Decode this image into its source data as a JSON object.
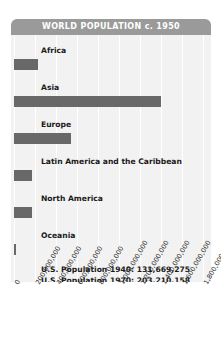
{
  "chart_data": {
    "type": "bar",
    "orientation": "horizontal",
    "title": "WORLD POPULATION c. 1950",
    "xlabel": "",
    "ylabel": "",
    "categories": [
      "Africa",
      "Asia",
      "Europe",
      "Latin America and the Caribbean",
      "North America",
      "Oceania"
    ],
    "values": [
      228000000,
      1400000000,
      547000000,
      167000000,
      172000000,
      13000000
    ],
    "xlim": [
      0,
      1800000000
    ],
    "tick_labels": [
      "0",
      "200,000,000",
      "400,000,000",
      "600,000,000",
      "800,000,000",
      "1,000,000,000",
      "1,200,000,000",
      "1,400,000,000",
      "1,600,000,000",
      "1,800,000,000"
    ],
    "tick_values": [
      0,
      200000000,
      400000000,
      600000000,
      800000000,
      1000000000,
      1200000000,
      1400000000,
      1600000000,
      1800000000
    ],
    "grid": true,
    "legend": "none",
    "annotations": [
      "U.S. Population 1940: 131,669,275",
      "U.S. Population 1970: 203,210,158"
    ],
    "colors": {
      "bar": "#686868",
      "plot_background": "#f2f2f2",
      "gridline": "#ffffff",
      "title_bar": "#9a9a9a",
      "title_text": "#ffffff",
      "label_text": "#1a1a1a"
    }
  }
}
